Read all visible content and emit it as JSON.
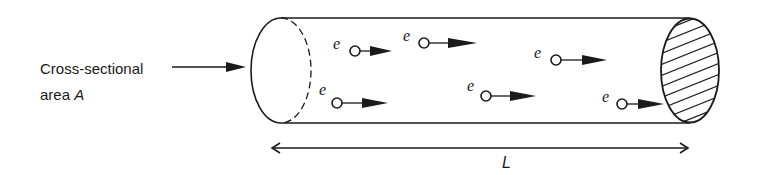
{
  "diagram": {
    "type": "physics-schematic",
    "label": {
      "line1": "Cross-sectional",
      "line2_prefix": "area ",
      "line2_var": "A"
    },
    "length_label": "L",
    "electron_symbol": "e",
    "electrons": [
      {
        "id": 1,
        "label": "e",
        "cx": 355,
        "cy": 51,
        "lx": 333,
        "ly": 49
      },
      {
        "id": 2,
        "label": "e",
        "cx": 424,
        "cy": 43,
        "lx": 403,
        "ly": 41
      },
      {
        "id": 3,
        "label": "e",
        "cx": 337,
        "cy": 103,
        "lx": 319,
        "ly": 95
      },
      {
        "id": 4,
        "label": "e",
        "cx": 486,
        "cy": 96,
        "lx": 467,
        "ly": 91
      },
      {
        "id": 5,
        "label": "e",
        "cx": 556,
        "cy": 60,
        "lx": 534,
        "ly": 58
      },
      {
        "id": 6,
        "label": "e",
        "cx": 622,
        "cy": 104,
        "lx": 602,
        "ly": 102
      }
    ],
    "colors": {
      "stroke": "#1a1a1a",
      "background": "#ffffff"
    }
  }
}
